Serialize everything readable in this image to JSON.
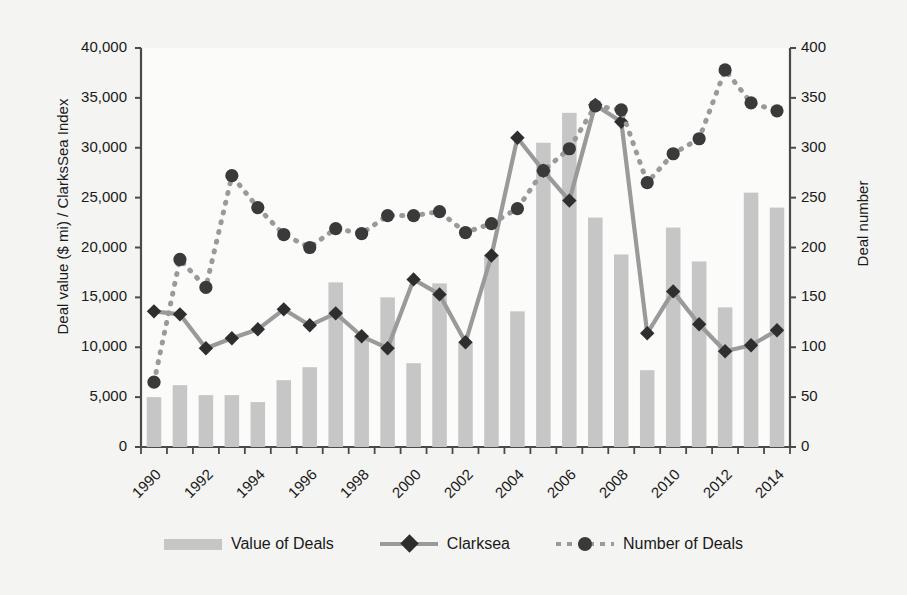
{
  "chart_data": {
    "type": "bar",
    "title": "",
    "xlabel": "",
    "ylabel": "Deal value ($ mi) / ClarksSea Index",
    "ylabel_right": "Deal number",
    "ylim": [
      0,
      40000
    ],
    "ylim_right": [
      0,
      400
    ],
    "yticks": [
      "0",
      "5,000",
      "10,000",
      "15,000",
      "20,000",
      "25,000",
      "30,000",
      "35,000",
      "40,000"
    ],
    "ytick_values": [
      0,
      5000,
      10000,
      15000,
      20000,
      25000,
      30000,
      35000,
      40000
    ],
    "yticks_right": [
      "0",
      "50",
      "100",
      "150",
      "200",
      "250",
      "300",
      "350",
      "400"
    ],
    "ytick_values_right": [
      0,
      50,
      100,
      150,
      200,
      250,
      300,
      350,
      400
    ],
    "grid": false,
    "legend_position": "bottom",
    "categories": [
      1990,
      1991,
      1992,
      1993,
      1994,
      1995,
      1996,
      1997,
      1998,
      1999,
      2000,
      2001,
      2002,
      2003,
      2004,
      2005,
      2006,
      2007,
      2008,
      2009,
      2010,
      2011,
      2012,
      2013,
      2014
    ],
    "xtick_labels": [
      "1990",
      "1992",
      "1994",
      "1996",
      "1998",
      "2000",
      "2002",
      "2004",
      "2006",
      "2008",
      "2010",
      "2012",
      "2014"
    ],
    "xtick_values": [
      1990,
      1992,
      1994,
      1996,
      1998,
      2000,
      2002,
      2004,
      2006,
      2008,
      2010,
      2012,
      2014
    ],
    "series": [
      {
        "name": "Value of Deals",
        "type": "bar",
        "axis": "left",
        "color": "#c6c6c6",
        "values": [
          5000,
          6200,
          5200,
          5200,
          4500,
          6700,
          8000,
          16500,
          11200,
          15000,
          8400,
          16400,
          10500,
          19300,
          13600,
          30500,
          33500,
          23000,
          19300,
          7700,
          22000,
          18600,
          14000,
          25500,
          24000
        ]
      },
      {
        "name": "Clarksea",
        "type": "line",
        "axis": "left",
        "color": "#9a9a9a",
        "marker": "diamond",
        "marker_color": "#2e2e2e",
        "line_style": "solid",
        "values": [
          13600,
          13300,
          9900,
          10900,
          11800,
          13800,
          12200,
          13400,
          11100,
          9900,
          16800,
          15300,
          10500,
          19200,
          31000,
          27700,
          24700,
          34300,
          32600,
          11400,
          15600,
          12300,
          9600,
          10200,
          11700
        ]
      },
      {
        "name": "Number of Deals",
        "type": "line",
        "axis": "right",
        "color": "#9a9a9a",
        "marker": "circle",
        "marker_color": "#3a3a3a",
        "line_style": "dotted",
        "values": [
          65,
          188,
          160,
          272,
          240,
          213,
          200,
          219,
          214,
          232,
          232,
          236,
          215,
          224,
          239,
          277,
          299,
          342,
          338,
          265,
          294,
          309,
          378,
          345,
          337
        ]
      }
    ]
  },
  "legend": {
    "items": [
      {
        "label": "Value of Deals",
        "swatch": "bar-swatch"
      },
      {
        "label": "Clarksea",
        "swatch": "solid-line-diamond-swatch"
      },
      {
        "label": "Number of Deals",
        "swatch": "dotted-line-circle-swatch"
      }
    ]
  },
  "colors": {
    "bar": "#c6c6c6",
    "line": "#9a9a9a",
    "diamond_marker": "#2e2e2e",
    "circle_marker": "#3a3a3a",
    "axis": "#4a4a4a",
    "background": "#f4f4f2",
    "plot_background": "#fbfbfa",
    "text": "#1a1a1a"
  }
}
